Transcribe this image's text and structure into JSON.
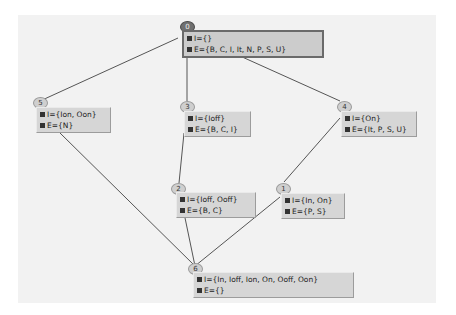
{
  "diagram": {
    "type": "lattice",
    "edge_color": "#555555",
    "nodes": [
      {
        "id": "0",
        "I": "I={}",
        "E": "E={B, C, I, It, N, P, S, U}",
        "selected": true
      },
      {
        "id": "1",
        "I": "I={In, On}",
        "E": "E={P, S}"
      },
      {
        "id": "2",
        "I": "I={Ioff, Ooff}",
        "E": "E={B, C}"
      },
      {
        "id": "3",
        "I": "I={Ioff}",
        "E": "E={B, C, I}"
      },
      {
        "id": "4",
        "I": "I={On}",
        "E": "E={It, P, S, U}"
      },
      {
        "id": "5",
        "I": "I={Ion, Oon}",
        "E": "E={N}"
      },
      {
        "id": "6",
        "I": "I={In, Ioff, Ion, On, Ooff, Oon}",
        "E": "E={}"
      }
    ],
    "edges": [
      {
        "from": "0",
        "to": "5"
      },
      {
        "from": "0",
        "to": "3"
      },
      {
        "from": "0",
        "to": "4"
      },
      {
        "from": "3",
        "to": "2"
      },
      {
        "from": "4",
        "to": "1"
      },
      {
        "from": "5",
        "to": "6"
      },
      {
        "from": "2",
        "to": "6"
      },
      {
        "from": "1",
        "to": "6"
      }
    ]
  }
}
